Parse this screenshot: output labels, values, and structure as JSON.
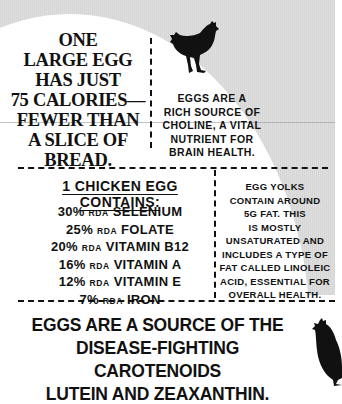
{
  "panels": {
    "calories": {
      "lines": [
        "ONE",
        "LARGE EGG",
        "HAS JUST",
        "75 CALORIES—",
        "FEWER THAN",
        "A SLICE OF",
        "BREAD."
      ]
    },
    "choline": {
      "lines": [
        "EGGS ARE A",
        "RICH SOURCE OF",
        "CHOLINE, A VITAL",
        "NUTRIENT FOR",
        "BRAIN HEALTH."
      ]
    },
    "contains": {
      "title": "1 CHICKEN EGG CONTAINS:",
      "items": [
        {
          "percent": "30%",
          "unit": "RDA",
          "nutrient": "SELENIUM"
        },
        {
          "percent": "25%",
          "unit": "RDA",
          "nutrient": "FOLATE"
        },
        {
          "percent": "20%",
          "unit": "RDA",
          "nutrient": "VITAMIN B12"
        },
        {
          "percent": "16%",
          "unit": "RDA",
          "nutrient": "VITAMIN A"
        },
        {
          "percent": "12%",
          "unit": "RDA",
          "nutrient": "VITAMIN E"
        },
        {
          "percent": "7%",
          "unit": "RDA",
          "nutrient": "IRON"
        }
      ]
    },
    "yolks": {
      "lines": [
        "EGG YOLKS",
        "CONTAIN AROUND",
        "5G FAT. THIS",
        "IS MOSTLY",
        "UNSATURATED AND",
        "INCLUDES A TYPE OF",
        "FAT CALLED LINOLEIC",
        "ACID, ESSENTIAL FOR",
        "OVERALL HEALTH."
      ]
    },
    "carotenoids": {
      "lines": [
        "EGGS ARE A SOURCE OF THE",
        "DISEASE-FIGHTING CAROTENOIDS",
        "LUTEIN AND ZEAXANTHIN."
      ]
    }
  },
  "icons": {
    "hen_top": "hen-silhouette-icon",
    "hen_bottom": "hen-silhouette-icon"
  },
  "colors": {
    "background_gray": "#d9d9d9",
    "text": "#111111",
    "egg_white": "#ffffff"
  }
}
